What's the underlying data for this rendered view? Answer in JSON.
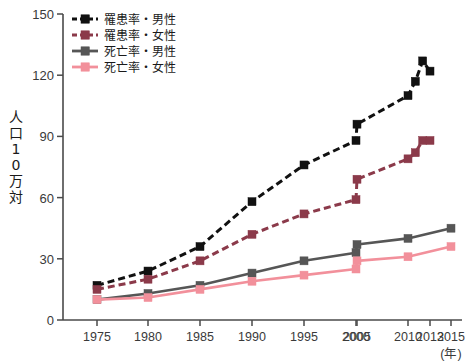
{
  "chart_data": {
    "type": "line",
    "title": "",
    "xlabel": "(年)",
    "ylabel": "人口10万対",
    "x": [
      1975,
      1980,
      1985,
      1990,
      1995,
      2000,
      2005,
      2010,
      2012,
      2013,
      2015
    ],
    "categories": [
      "1975",
      "1980",
      "1985",
      "1990",
      "1995",
      "2000",
      "2005",
      "2010",
      "2013",
      "2015"
    ],
    "xtick_labels": [
      "1975",
      "1980",
      "1985",
      "1990",
      "1995",
      "2000",
      "2005",
      "2010",
      "2013",
      "2015"
    ],
    "xtick_values": [
      1975,
      1980,
      1985,
      1990,
      1995,
      2000,
      2005,
      2010,
      2013,
      2015
    ],
    "ytick_labels": [
      "0",
      "30",
      "60",
      "90",
      "120",
      "150"
    ],
    "ytick_values": [
      0,
      30,
      60,
      90,
      120,
      150
    ],
    "xlim": [
      1973,
      2016
    ],
    "ylim": [
      0,
      150
    ],
    "grid": false,
    "legend_position": "top-left",
    "series": [
      {
        "name": "罹患率・男性",
        "color": "#111111",
        "style": "dashed",
        "marker": "square",
        "x": [
          1975,
          1980,
          1985,
          1990,
          1995,
          2000,
          2005,
          2010,
          2011,
          2012,
          2013
        ],
        "values": [
          17,
          24,
          36,
          58,
          76,
          88,
          96,
          110,
          117,
          127,
          122
        ]
      },
      {
        "name": "罹患率・女性",
        "color": "#8b3a4a",
        "style": "dashed",
        "marker": "square",
        "x": [
          1975,
          1980,
          1985,
          1990,
          1995,
          2000,
          2005,
          2010,
          2011,
          2012,
          2013
        ],
        "values": [
          15,
          20,
          29,
          42,
          52,
          59,
          69,
          79,
          82,
          88,
          88
        ]
      },
      {
        "name": "死亡率・男性",
        "color": "#565656",
        "style": "solid",
        "marker": "square",
        "x": [
          1975,
          1980,
          1985,
          1990,
          1995,
          2000,
          2005,
          2010,
          2015
        ],
        "values": [
          10,
          13,
          17,
          23,
          29,
          33,
          37,
          40,
          45
        ]
      },
      {
        "name": "死亡率・女性",
        "color": "#f2909b",
        "style": "solid",
        "marker": "square",
        "x": [
          1975,
          1980,
          1985,
          1990,
          1995,
          2000,
          2005,
          2010,
          2015
        ],
        "values": [
          10,
          11,
          15,
          19,
          22,
          25,
          29,
          31,
          36
        ]
      }
    ]
  },
  "axis": {
    "y_unit_label_chars": [
      "人",
      "口",
      "1",
      "0",
      "万",
      "対"
    ],
    "x_unit_label": "(年)"
  },
  "legend": {
    "items": [
      {
        "label": "罹患率・男性"
      },
      {
        "label": "罹患率・女性"
      },
      {
        "label": "死亡率・男性"
      },
      {
        "label": "死亡率・女性"
      }
    ]
  }
}
